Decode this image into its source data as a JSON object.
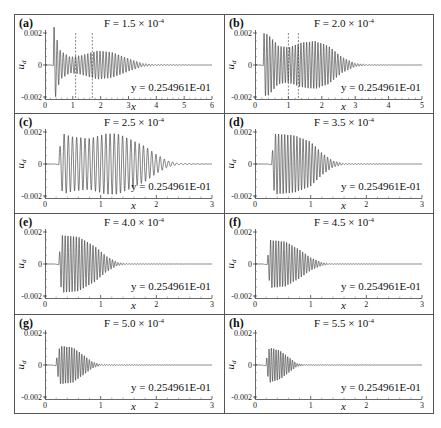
{
  "figure": {
    "width": 441,
    "height": 428,
    "frame_color": "#555555",
    "line_color": "#333333"
  },
  "chart_data": [
    {
      "id": "a",
      "panel_label": "(a)",
      "type": "line",
      "title": "F = 1.5 × 10",
      "title_exp": "-4",
      "xlabel": "x",
      "ylabel": "u",
      "ylabel_sub": "d",
      "annotation": "y =  0.254961E-01",
      "xlim": [
        0,
        6
      ],
      "ylim": [
        -0.002,
        0.002
      ],
      "xticks": [
        "0",
        "1",
        "2",
        "3",
        "4",
        "5",
        "6"
      ],
      "yticks": [
        "0.002",
        "0",
        "-0.002"
      ],
      "dashed_vlines": [
        1.1,
        1.7
      ],
      "signal": {
        "onset": 0.3,
        "period": 0.11,
        "envelope": [
          [
            0.3,
            0.0028
          ],
          [
            0.4,
            0.0018
          ],
          [
            0.55,
            0.0009
          ],
          [
            0.9,
            0.0005
          ],
          [
            1.3,
            0.0006
          ],
          [
            1.9,
            0.0009
          ],
          [
            2.4,
            0.0008
          ],
          [
            3.0,
            0.0004
          ],
          [
            3.5,
            0.0001
          ],
          [
            4.0,
            3e-05
          ],
          [
            6.0,
            0.0
          ]
        ]
      }
    },
    {
      "id": "b",
      "panel_label": "(b)",
      "type": "line",
      "title": "F = 2.0 × 10",
      "title_exp": "-4",
      "xlabel": "x",
      "ylabel": "u",
      "ylabel_sub": "d",
      "annotation": "y =  0.254961E-01",
      "xlim": [
        0,
        3
      ],
      "ylim": [
        -0.002,
        0.002
      ],
      "xticks": [
        "0",
        "1",
        "2",
        "3",
        "4",
        "5"
      ],
      "yticks": [
        "0.002",
        "-0.002"
      ],
      "dashed_vlines": [
        1.0,
        1.3
      ],
      "signal": {
        "onset": 0.25,
        "period": 0.085,
        "envelope": [
          [
            0.25,
            0.002
          ],
          [
            0.4,
            0.0019
          ],
          [
            0.7,
            0.0012
          ],
          [
            1.0,
            0.0011
          ],
          [
            1.4,
            0.0014
          ],
          [
            1.8,
            0.0015
          ],
          [
            2.2,
            0.0012
          ],
          [
            2.6,
            0.0005
          ],
          [
            3.0,
            0.0001
          ],
          [
            3.4,
            2e-05
          ],
          [
            5.0,
            0.0
          ]
        ]
      },
      "xlim_display": [
        0,
        5
      ]
    },
    {
      "id": "c",
      "panel_label": "(c)",
      "type": "line",
      "title": "F = 2.5 × 10",
      "title_exp": "-4",
      "xlabel": "x",
      "ylabel": "u",
      "ylabel_sub": "d",
      "annotation": "y =  0.254961E-01",
      "xlim": [
        0,
        3
      ],
      "ylim": [
        -0.002,
        0.002
      ],
      "xticks": [
        "0",
        "1",
        "2",
        "3"
      ],
      "yticks": [
        "0.002",
        "0",
        "-0.002"
      ],
      "dashed_vlines": [],
      "signal": {
        "onset": 0.25,
        "period": 0.075,
        "envelope": [
          [
            0.25,
            0.0008
          ],
          [
            0.32,
            0.0019
          ],
          [
            0.5,
            0.0017
          ],
          [
            0.8,
            0.0016
          ],
          [
            1.1,
            0.0019
          ],
          [
            1.3,
            0.0019
          ],
          [
            1.5,
            0.0016
          ],
          [
            1.8,
            0.0011
          ],
          [
            2.0,
            0.0006
          ],
          [
            2.2,
            0.0002
          ],
          [
            2.4,
            4e-05
          ],
          [
            3.0,
            0.0
          ]
        ]
      }
    },
    {
      "id": "d",
      "panel_label": "(d)",
      "type": "line",
      "title": "F = 3.5 × 10",
      "title_exp": "-4",
      "xlabel": "x",
      "ylabel": "u",
      "ylabel_sub": "d",
      "annotation": "y =  0.254961E-01",
      "xlim": [
        0,
        3
      ],
      "ylim": [
        -0.002,
        0.002
      ],
      "xticks": [
        "0",
        "1",
        "2",
        "3"
      ],
      "yticks": [
        "0.002",
        "0",
        "-0.002"
      ],
      "dashed_vlines": [],
      "signal": {
        "onset": 0.3,
        "period": 0.055,
        "envelope": [
          [
            0.3,
            0.0004
          ],
          [
            0.35,
            0.0019
          ],
          [
            0.7,
            0.0018
          ],
          [
            1.0,
            0.0014
          ],
          [
            1.2,
            0.0007
          ],
          [
            1.4,
            0.0002
          ],
          [
            1.6,
            3e-05
          ],
          [
            3.0,
            0.0
          ]
        ]
      }
    },
    {
      "id": "e",
      "panel_label": "(e)",
      "type": "line",
      "title": "F = 4.0 × 10",
      "title_exp": "-4",
      "xlabel": "x",
      "ylabel": "u",
      "ylabel_sub": "d",
      "annotation": "y =  0.254961E-01",
      "xlim": [
        0,
        3
      ],
      "ylim": [
        -0.002,
        0.002
      ],
      "xticks": [
        "0",
        "1",
        "2",
        "3"
      ],
      "yticks": [
        "0.002",
        "0",
        "-0.002"
      ],
      "dashed_vlines": [],
      "signal": {
        "onset": 0.25,
        "period": 0.05,
        "envelope": [
          [
            0.25,
            0.0004
          ],
          [
            0.3,
            0.0018
          ],
          [
            0.6,
            0.0017
          ],
          [
            0.9,
            0.0011
          ],
          [
            1.1,
            0.0005
          ],
          [
            1.3,
            0.0001
          ],
          [
            1.5,
            2e-05
          ],
          [
            3.0,
            0.0
          ]
        ]
      }
    },
    {
      "id": "f",
      "panel_label": "(f)",
      "type": "line",
      "title": "F = 4.5 × 10",
      "title_exp": "-4",
      "xlabel": "x",
      "ylabel": "u",
      "ylabel_sub": "d",
      "annotation": "y =  0.254961E-01",
      "xlim": [
        0,
        3
      ],
      "ylim": [
        -0.002,
        0.002
      ],
      "xticks": [
        "0",
        "1",
        "2",
        "3"
      ],
      "yticks": [
        "0.002",
        "0",
        "-0.002"
      ],
      "dashed_vlines": [],
      "signal": {
        "onset": 0.22,
        "period": 0.048,
        "envelope": [
          [
            0.22,
            0.0003
          ],
          [
            0.28,
            0.0015
          ],
          [
            0.55,
            0.0014
          ],
          [
            0.8,
            0.0009
          ],
          [
            1.0,
            0.0004
          ],
          [
            1.2,
            0.0001
          ],
          [
            1.35,
            2e-05
          ],
          [
            3.0,
            0.0
          ]
        ]
      }
    },
    {
      "id": "g",
      "panel_label": "(g)",
      "type": "line",
      "title": "F = 5.0 × 10",
      "title_exp": "-4",
      "xlabel": "x",
      "ylabel": "u",
      "ylabel_sub": "d",
      "annotation": "y =  0.254961E-01",
      "xlim": [
        0,
        3
      ],
      "ylim": [
        -0.002,
        0.002
      ],
      "xticks": [
        "0",
        "1",
        "2",
        "3"
      ],
      "yticks": [
        "0.002",
        "0",
        "-0.002"
      ],
      "dashed_vlines": [],
      "signal": {
        "onset": 0.2,
        "period": 0.045,
        "envelope": [
          [
            0.2,
            0.0003
          ],
          [
            0.27,
            0.0012
          ],
          [
            0.5,
            0.0011
          ],
          [
            0.7,
            0.0006
          ],
          [
            0.85,
            0.0002
          ],
          [
            1.0,
            3e-05
          ],
          [
            3.0,
            0.0
          ]
        ]
      }
    },
    {
      "id": "h",
      "panel_label": "(h)",
      "type": "line",
      "title": "F = 5.5 × 10",
      "title_exp": "-4",
      "xlabel": "x",
      "ylabel": "u",
      "ylabel_sub": "d",
      "annotation": "y =  0.254961E-01",
      "xlim": [
        0,
        3
      ],
      "ylim": [
        -0.002,
        0.002
      ],
      "xticks": [
        "0",
        "1",
        "2",
        "3"
      ],
      "yticks": [
        "0.002",
        "0",
        "-0.002"
      ],
      "dashed_vlines": [],
      "signal": {
        "onset": 0.2,
        "period": 0.042,
        "envelope": [
          [
            0.2,
            0.0003
          ],
          [
            0.26,
            0.0011
          ],
          [
            0.45,
            0.0009
          ],
          [
            0.6,
            0.0005
          ],
          [
            0.75,
            0.0001
          ],
          [
            0.9,
            2e-05
          ],
          [
            3.0,
            0.0
          ]
        ]
      }
    }
  ]
}
